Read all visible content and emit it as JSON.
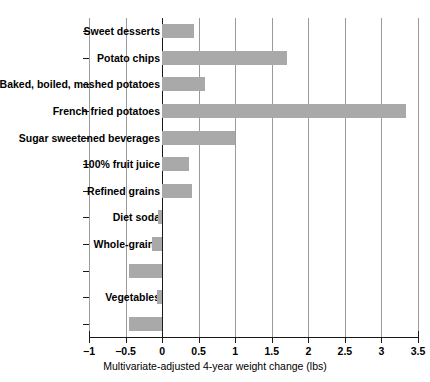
{
  "chart_data": {
    "type": "bar",
    "orientation": "horizontal",
    "title": "",
    "xlabel": "Multivariate-adjusted 4-year weight change (lbs)",
    "ylabel": "",
    "xlim": [
      -1,
      3.5
    ],
    "xticks": [
      -1,
      -0.5,
      0,
      0.5,
      1,
      1.5,
      2,
      2.5,
      3,
      3.5
    ],
    "xticklabels": [
      "−1",
      "−0.5",
      "0",
      "0.5",
      "1",
      "1.5",
      "2",
      "2.5",
      "3",
      "3.5"
    ],
    "grid": true,
    "grid_axis": "x",
    "legend": "none",
    "bar_color": "#a9a9a9",
    "zero_line_color": "#1a1a1a",
    "categories": [
      "Sweet desserts",
      "Potato chips",
      "Baked, boiled, mashed potatoes",
      "French fried potatoes",
      "Sugar sweetened beverages",
      "100% fruit juice",
      "Refined grains",
      "Diet soda",
      "Whole-grains",
      "Nuts",
      "Vegetables",
      "Fruit"
    ],
    "values": [
      0.44,
      1.71,
      0.59,
      3.33,
      1.0,
      0.37,
      0.41,
      -0.05,
      -0.14,
      -0.45,
      -0.07,
      -0.45
    ],
    "series": [
      {
        "name": "Multivariate-adjusted 4-year weight change (lbs)",
        "values": [
          0.44,
          1.71,
          0.59,
          3.33,
          1.0,
          0.37,
          0.41,
          -0.05,
          -0.14,
          -0.45,
          -0.07,
          -0.45
        ]
      }
    ]
  }
}
